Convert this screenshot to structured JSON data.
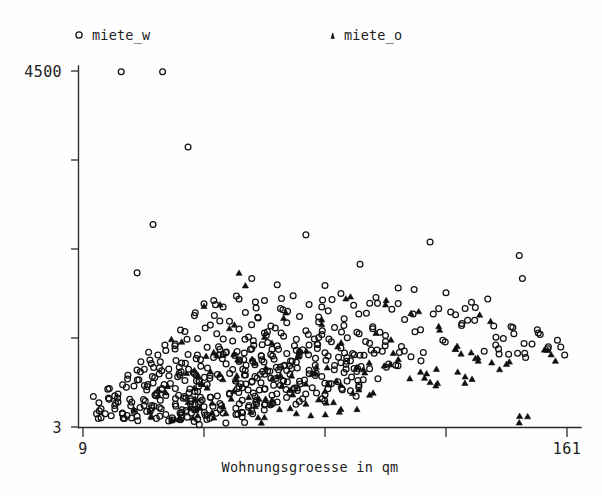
{
  "chart_data": {
    "type": "scatter",
    "title": "",
    "xlabel": "Wohnungsgroesse in qm",
    "ylabel": "",
    "xlim": [
      9,
      161
    ],
    "ylim": [
      3,
      4500
    ],
    "xticks": [
      9,
      47,
      85,
      123,
      161
    ],
    "xticklabels": [
      "9",
      "",
      "",
      "",
      "161"
    ],
    "yticks": [
      3,
      1127,
      2251,
      3376,
      4500
    ],
    "yticklabels": [
      "3",
      "",
      "",
      "",
      "4500"
    ],
    "grid": false,
    "legend_position": "above-plot",
    "series": [
      {
        "name": "miete_w",
        "marker": "circle",
        "color": "#101010",
        "points": [
          [
            21,
            4490
          ],
          [
            34,
            4490
          ],
          [
            42,
            3540
          ],
          [
            31,
            2560
          ],
          [
            79,
            2430
          ],
          [
            118,
            2340
          ],
          [
            146,
            2170
          ],
          [
            96,
            2060
          ],
          [
            26,
            1950
          ],
          [
            147,
            1880
          ],
          [
            62,
            1880
          ],
          [
            70,
            1800
          ],
          [
            85,
            1790
          ],
          [
            108,
            1760
          ],
          [
            113,
            1740
          ],
          [
            123,
            1700
          ],
          [
            90,
            1690
          ],
          [
            75,
            1660
          ],
          [
            101,
            1640
          ],
          [
            58,
            1620
          ],
          [
            66,
            1600
          ],
          [
            131,
            1580
          ],
          [
            47,
            1560
          ],
          [
            80,
            1550
          ],
          [
            94,
            1540
          ],
          [
            53,
            1520
          ],
          [
            71,
            1500
          ],
          [
            106,
            1490
          ],
          [
            86,
            1470
          ],
          [
            60,
            1450
          ],
          [
            98,
            1440
          ],
          [
            119,
            1430
          ],
          [
            44,
            1410
          ],
          [
            77,
            1400
          ],
          [
            64,
            1380
          ],
          [
            91,
            1370
          ],
          [
            110,
            1360
          ],
          [
            55,
            1340
          ],
          [
            83,
            1330
          ],
          [
            73,
            1320
          ],
          [
            128,
            1310
          ],
          [
            49,
            1290
          ],
          [
            68,
            1280
          ],
          [
            100,
            1270
          ],
          [
            88,
            1260
          ],
          [
            58,
            1240
          ],
          [
            115,
            1230
          ],
          [
            79,
            1220
          ],
          [
            41,
            1210
          ],
          [
            95,
            1200
          ],
          [
            66,
            1190
          ],
          [
            51,
            1180
          ],
          [
            84,
            1170
          ],
          [
            104,
            1160
          ],
          [
            72,
            1150
          ],
          [
            61,
            1140
          ],
          [
            92,
            1130
          ],
          [
            45,
            1120
          ],
          [
            76,
            1110
          ],
          [
            122,
            1100
          ],
          [
            56,
            1090
          ],
          [
            87,
            1080
          ],
          [
            67,
            1070
          ],
          [
            99,
            1060
          ],
          [
            38,
            1050
          ],
          [
            80,
            1040
          ],
          [
            70,
            1030
          ],
          [
            109,
            1020
          ],
          [
            48,
            1010
          ],
          [
            90,
            1000
          ],
          [
            62,
            990
          ],
          [
            78,
            980
          ],
          [
            35,
            970
          ],
          [
            103,
            960
          ],
          [
            54,
            950
          ],
          [
            85,
            940
          ],
          [
            73,
            930
          ],
          [
            42,
            920
          ],
          [
            96,
            910
          ],
          [
            65,
            900
          ],
          [
            112,
            890
          ],
          [
            50,
            880
          ],
          [
            82,
            870
          ],
          [
            69,
            860
          ],
          [
            30,
            850
          ],
          [
            93,
            840
          ],
          [
            58,
            830
          ],
          [
            76,
            820
          ],
          [
            40,
            810
          ],
          [
            105,
            800
          ],
          [
            63,
            790
          ],
          [
            88,
            780
          ],
          [
            46,
            770
          ],
          [
            71,
            760
          ],
          [
            33,
            750
          ],
          [
            99,
            740
          ],
          [
            56,
            730
          ],
          [
            80,
            720
          ],
          [
            67,
            710
          ],
          [
            27,
            700
          ],
          [
            91,
            690
          ],
          [
            44,
            680
          ],
          [
            74,
            670
          ],
          [
            60,
            660
          ],
          [
            36,
            650
          ],
          [
            84,
            640
          ],
          [
            52,
            630
          ],
          [
            68,
            620
          ],
          [
            23,
            610
          ],
          [
            97,
            600
          ],
          [
            41,
            590
          ],
          [
            77,
            580
          ],
          [
            62,
            570
          ],
          [
            31,
            560
          ],
          [
            87,
            550
          ],
          [
            48,
            540
          ],
          [
            71,
            530
          ],
          [
            25,
            520
          ],
          [
            58,
            510
          ],
          [
            81,
            500
          ],
          [
            38,
            490
          ],
          [
            66,
            480
          ],
          [
            29,
            470
          ],
          [
            93,
            460
          ],
          [
            45,
            450
          ],
          [
            74,
            440
          ],
          [
            55,
            430
          ],
          [
            20,
            420
          ],
          [
            85,
            410
          ],
          [
            35,
            400
          ],
          [
            63,
            390
          ],
          [
            49,
            380
          ],
          [
            17,
            370
          ],
          [
            78,
            360
          ],
          [
            28,
            350
          ],
          [
            59,
            340
          ],
          [
            43,
            330
          ],
          [
            70,
            320
          ],
          [
            14,
            310
          ],
          [
            52,
            300
          ],
          [
            38,
            290
          ],
          [
            66,
            280
          ],
          [
            24,
            270
          ],
          [
            47,
            260
          ],
          [
            33,
            250
          ],
          [
            57,
            240
          ],
          [
            19,
            230
          ],
          [
            44,
            220
          ],
          [
            62,
            210
          ],
          [
            29,
            200
          ],
          [
            40,
            190
          ],
          [
            53,
            180
          ],
          [
            16,
            170
          ],
          [
            35,
            160
          ],
          [
            48,
            150
          ],
          [
            26,
            140
          ],
          [
            59,
            130
          ],
          [
            37,
            120
          ],
          [
            22,
            110
          ],
          [
            45,
            100
          ],
          [
            132,
            1350
          ],
          [
            138,
            1280
          ],
          [
            141,
            1120
          ],
          [
            150,
            1050
          ],
          [
            155,
            990
          ],
          [
            126,
            1420
          ],
          [
            144,
            1260
          ],
          [
            158,
            1100
          ],
          [
            135,
            960
          ],
          [
            148,
            880
          ],
          [
            129,
            1500
          ],
          [
            152,
            1190
          ]
        ]
      },
      {
        "name": "miete_o",
        "marker": "triangle",
        "color": "#101010",
        "points": [
          [
            60,
            1790
          ],
          [
            93,
            1650
          ],
          [
            47,
            1530
          ],
          [
            112,
            1440
          ],
          [
            72,
            1380
          ],
          [
            84,
            1300
          ],
          [
            55,
            1250
          ],
          [
            101,
            1190
          ],
          [
            66,
            1140
          ],
          [
            40,
            1080
          ],
          [
            89,
            1020
          ],
          [
            77,
            970
          ],
          [
            51,
            910
          ],
          [
            108,
            860
          ],
          [
            63,
            810
          ],
          [
            95,
            760
          ],
          [
            44,
            720
          ],
          [
            81,
            680
          ],
          [
            70,
            640
          ],
          [
            57,
            600
          ],
          [
            118,
            570
          ],
          [
            86,
            540
          ],
          [
            48,
            500
          ],
          [
            74,
            470
          ],
          [
            35,
            440
          ],
          [
            99,
            410
          ],
          [
            61,
            380
          ],
          [
            83,
            350
          ],
          [
            42,
            320
          ],
          [
            68,
            290
          ],
          [
            53,
            260
          ],
          [
            90,
            230
          ],
          [
            30,
            200
          ],
          [
            76,
            175
          ],
          [
            45,
            150
          ],
          [
            64,
            125
          ],
          [
            38,
            100
          ],
          [
            126,
            990
          ],
          [
            133,
            880
          ],
          [
            142,
            800
          ],
          [
            121,
            1230
          ],
          [
            137,
            1340
          ],
          [
            156,
            920
          ],
          [
            129,
            640
          ],
          [
            146,
            60
          ],
          [
            115,
            700
          ],
          [
            104,
            1550
          ],
          [
            58,
            1950
          ]
        ]
      }
    ]
  },
  "legend": {
    "entries": [
      {
        "label": "miete_w",
        "marker": "circle"
      },
      {
        "label": "miete_o",
        "marker": "triangle"
      }
    ]
  },
  "axes": {
    "x_title": "Wohnungsgroesse in qm",
    "x_min_label": "9",
    "x_max_label": "161",
    "y_min_label": "3",
    "y_max_label": "4500"
  }
}
